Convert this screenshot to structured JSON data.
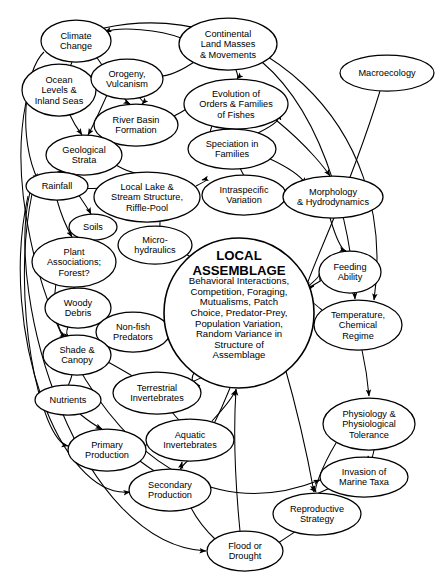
{
  "diagram": {
    "type": "concept-map",
    "background": "#ffffff",
    "line_color": "#000000",
    "width": 442,
    "height": 585,
    "central_node": {
      "id": "local-assemblage",
      "title_lines": [
        "LOCAL",
        "ASSEMBLAGE"
      ],
      "body_lines": [
        "Behavioral Interactions,",
        "Competition, Foraging,",
        "Mutualisms, Patch",
        "Choice, Predator-Prey,",
        "Population Variation,",
        "Random Variance in",
        "Structure of",
        "Assemblage"
      ],
      "cx": 239,
      "cy": 313,
      "rx": 75,
      "ry": 75
    },
    "nodes": [
      {
        "id": "climate-change",
        "lines": [
          "Climate",
          "Change"
        ],
        "cx": 76,
        "cy": 41,
        "rx": 35,
        "ry": 21
      },
      {
        "id": "continental-land-masses",
        "lines": [
          "Continental",
          "Land Masses",
          "& Movements"
        ],
        "cx": 228,
        "cy": 44,
        "rx": 49,
        "ry": 26
      },
      {
        "id": "macroecology",
        "lines": [
          "Macroecology"
        ],
        "cx": 387,
        "cy": 73,
        "rx": 47,
        "ry": 18
      },
      {
        "id": "ocean-levels",
        "lines": [
          "Ocean",
          "Levels &",
          "Inland Seas"
        ],
        "cx": 59,
        "cy": 90,
        "rx": 37,
        "ry": 26
      },
      {
        "id": "orogeny-vulcanism",
        "lines": [
          "Orogeny,",
          "Vulcanism"
        ],
        "cx": 127,
        "cy": 79,
        "rx": 36,
        "ry": 20
      },
      {
        "id": "evolution-orders",
        "lines": [
          "Evolution of",
          "Orders & Families",
          "of Fishes"
        ],
        "cx": 236,
        "cy": 104,
        "rx": 52,
        "ry": 25
      },
      {
        "id": "river-basin-formation",
        "lines": [
          "River Basin",
          "Formation"
        ],
        "cx": 136,
        "cy": 125,
        "rx": 42,
        "ry": 21
      },
      {
        "id": "speciation-in-families",
        "lines": [
          "Speciation in",
          "Families"
        ],
        "cx": 232,
        "cy": 149,
        "rx": 44,
        "ry": 20
      },
      {
        "id": "geological-strata",
        "lines": [
          "Geological",
          "Strata"
        ],
        "cx": 84,
        "cy": 155,
        "rx": 38,
        "ry": 20
      },
      {
        "id": "rainfall",
        "lines": [
          "Rainfall"
        ],
        "cx": 57,
        "cy": 186,
        "rx": 31,
        "ry": 14
      },
      {
        "id": "local-lake-stream",
        "lines": [
          "Local Lake &",
          "Stream Structure,",
          "Riffle-Pool"
        ],
        "cx": 147,
        "cy": 197,
        "rx": 53,
        "ry": 25
      },
      {
        "id": "intraspecific-variation",
        "lines": [
          "Intraspecific",
          "Variation"
        ],
        "cx": 244,
        "cy": 195,
        "rx": 42,
        "ry": 20
      },
      {
        "id": "morphology-hydrodynamics",
        "lines": [
          "Morphology",
          "& Hydrodynamics"
        ],
        "cx": 333,
        "cy": 197,
        "rx": 50,
        "ry": 21
      },
      {
        "id": "soils",
        "lines": [
          "Soils"
        ],
        "cx": 93,
        "cy": 227,
        "rx": 24,
        "ry": 13
      },
      {
        "id": "micro-hydraulics",
        "lines": [
          "Micro-",
          "hydraulics"
        ],
        "cx": 155,
        "cy": 245,
        "rx": 37,
        "ry": 19
      },
      {
        "id": "plant-associations",
        "lines": [
          "Plant",
          "Associations;",
          "Forest?"
        ],
        "cx": 74,
        "cy": 262,
        "rx": 42,
        "ry": 25
      },
      {
        "id": "feeding-ability",
        "lines": [
          "Feeding",
          "Ability"
        ],
        "cx": 350,
        "cy": 272,
        "rx": 31,
        "ry": 21
      },
      {
        "id": "woody-debris",
        "lines": [
          "Woody",
          "Debris"
        ],
        "cx": 78,
        "cy": 308,
        "rx": 33,
        "ry": 20
      },
      {
        "id": "non-fish-predators",
        "lines": [
          "Non-fish",
          "Predators"
        ],
        "cx": 133,
        "cy": 332,
        "rx": 37,
        "ry": 20
      },
      {
        "id": "temperature-chemical",
        "lines": [
          "Temperature,",
          "Chemical",
          "Regime"
        ],
        "cx": 358,
        "cy": 325,
        "rx": 44,
        "ry": 25
      },
      {
        "id": "shade-canopy",
        "lines": [
          "Shade &",
          "Canopy"
        ],
        "cx": 77,
        "cy": 355,
        "rx": 34,
        "ry": 20
      },
      {
        "id": "terrestrial-invertebrates",
        "lines": [
          "Terrestrial",
          "Invertebrates"
        ],
        "cx": 157,
        "cy": 393,
        "rx": 44,
        "ry": 21
      },
      {
        "id": "nutrients",
        "lines": [
          "Nutrients"
        ],
        "cx": 68,
        "cy": 400,
        "rx": 33,
        "ry": 15
      },
      {
        "id": "physiology-tolerance",
        "lines": [
          "Physiology &",
          "Physiological",
          "Tolerance"
        ],
        "cx": 369,
        "cy": 424,
        "rx": 46,
        "ry": 26
      },
      {
        "id": "aquatic-invertebrates",
        "lines": [
          "Aquatic",
          "Invertebrates"
        ],
        "cx": 190,
        "cy": 440,
        "rx": 44,
        "ry": 21
      },
      {
        "id": "primary-production",
        "lines": [
          "Primary",
          "Production"
        ],
        "cx": 107,
        "cy": 450,
        "rx": 39,
        "ry": 21
      },
      {
        "id": "invasion-marine-taxa",
        "lines": [
          "Invasion of",
          "Marine Taxa"
        ],
        "cx": 364,
        "cy": 477,
        "rx": 44,
        "ry": 20
      },
      {
        "id": "secondary-production",
        "lines": [
          "Secondary",
          "Production"
        ],
        "cx": 170,
        "cy": 490,
        "rx": 41,
        "ry": 21
      },
      {
        "id": "reproductive-strategy",
        "lines": [
          "Reproductive",
          "Strategy"
        ],
        "cx": 317,
        "cy": 514,
        "rx": 44,
        "ry": 21
      },
      {
        "id": "flood-or-drought",
        "lines": [
          "Flood or",
          "Drought"
        ],
        "cx": 245,
        "cy": 551,
        "rx": 38,
        "ry": 20
      }
    ],
    "edges": [
      {
        "from": "continental-land-masses",
        "to": "climate-change",
        "d": "M 181,38 C 160,30 120,26 105,32",
        "arrow": true
      },
      {
        "from": "continental-land-masses",
        "to": "orogeny-vulcanism",
        "d": "M 197,60 C 180,72 165,78 153,76",
        "arrow": true
      },
      {
        "from": "continental-land-masses",
        "to": "evolution-orders",
        "d": "M 236,70 C 238,75 238,78 237,79",
        "arrow": true
      },
      {
        "from": "climate-change",
        "to": "ocean-levels",
        "d": "M 72,62 C 70,68 68,70 66,64",
        "arrow": true
      },
      {
        "from": "climate-change",
        "to": "river-basin-formation",
        "d": "M 95,55 C 112,78 122,100 130,104",
        "arrow": true
      },
      {
        "from": "climate-change",
        "to": "rainfall",
        "d": "M 44,52 C 24,70 18,140 38,180",
        "arrow": true
      },
      {
        "from": "orogeny-vulcanism",
        "to": "river-basin-formation",
        "d": "M 140,98 C 146,106 146,100 142,104",
        "arrow": true
      },
      {
        "from": "orogeny-vulcanism",
        "to": "geological-strata",
        "d": "M 107,95 C 98,115 92,128 88,135",
        "arrow": true
      },
      {
        "from": "ocean-levels",
        "to": "geological-strata",
        "d": "M 70,115 C 76,128 80,132 82,135",
        "arrow": true
      },
      {
        "from": "river-basin-formation",
        "to": "geological-strata",
        "d": "M 110,137 C 100,143 96,146 94,148",
        "arrow": true
      },
      {
        "from": "river-basin-formation",
        "to": "evolution-orders",
        "d": "M 172,117 C 186,110 190,107 184,108",
        "arrow": true
      },
      {
        "from": "evolution-orders",
        "to": "speciation-in-families",
        "d": "M 212,126 C 208,136 210,140 214,137",
        "arrow": true
      },
      {
        "from": "speciation-in-families",
        "to": "intraspecific-variation",
        "d": "M 240,168 C 243,174 244,176 244,175",
        "arrow": true
      },
      {
        "from": "speciation-in-families",
        "to": "morphology-hydrodynamics",
        "d": "M 268,158 C 290,168 302,178 306,184",
        "arrow": true
      },
      {
        "from": "geological-strata",
        "to": "local-lake-stream",
        "d": "M 114,164 C 128,172 136,174 140,173",
        "arrow": true
      },
      {
        "from": "geological-strata",
        "to": "rainfall",
        "d": "M 66,170 C 60,174 58,172 57,172",
        "arrow": true
      },
      {
        "from": "rainfall",
        "to": "soils",
        "d": "M 78,194 C 86,206 90,212 91,214",
        "arrow": true
      },
      {
        "from": "rainfall",
        "to": "local-lake-stream",
        "d": "M 84,188 C 102,190 110,186 106,182",
        "arrow": true
      },
      {
        "from": "rainfall",
        "to": "plant-associations",
        "d": "M 57,200 C 62,218 68,230 72,237",
        "arrow": true
      },
      {
        "from": "local-lake-stream",
        "to": "micro-hydraulics",
        "d": "M 160,222 C 160,230 158,234 157,226",
        "arrow": true
      },
      {
        "from": "local-lake-stream",
        "to": "intraspecific-variation",
        "d": "M 196,186 C 208,180 210,178 202,180",
        "arrow": true
      },
      {
        "from": "intraspecific-variation",
        "to": "morphology-hydrodynamics",
        "d": "M 286,197 C 294,198 292,198 283,197",
        "arrow": true
      },
      {
        "from": "morphology-hydrodynamics",
        "to": "feeding-ability",
        "d": "M 330,218 C 336,238 342,250 346,251",
        "arrow": true
      },
      {
        "from": "soils",
        "to": "plant-associations",
        "d": "M 88,240 C 86,244 84,244 82,238",
        "arrow": true
      },
      {
        "from": "micro-hydraulics",
        "to": "local-assemblage",
        "d": "M 182,252 C 200,262 210,268 212,270",
        "arrow": true
      },
      {
        "from": "plant-associations",
        "to": "woody-debris",
        "d": "M 74,287 C 76,294 78,296 78,288",
        "arrow": true
      },
      {
        "from": "plant-associations",
        "to": "shade-canopy",
        "d": "M 56,283 C 52,310 58,332 66,338",
        "arrow": true
      },
      {
        "from": "woody-debris",
        "to": "non-fish-predators",
        "d": "M 108,318 C 120,324 126,326 128,322",
        "arrow": true
      },
      {
        "from": "woody-debris",
        "to": "shade-canopy",
        "d": "M 68,327 C 66,332 66,336 70,336",
        "arrow": true
      },
      {
        "from": "non-fish-predators",
        "to": "local-assemblage",
        "d": "M 170,330 C 184,326 190,322 186,324",
        "arrow": true
      },
      {
        "from": "local-assemblage",
        "to": "non-fish-predators",
        "d": "M 178,300 C 190,304 186,310 172,318",
        "arrow": true
      },
      {
        "from": "shade-canopy",
        "to": "nutrients",
        "d": "M 72,375 C 70,382 68,386 68,385",
        "arrow": true
      },
      {
        "from": "shade-canopy",
        "to": "terrestrial-invertebrates",
        "d": "M 108,362 C 126,372 136,378 140,381",
        "arrow": true
      },
      {
        "from": "nutrients",
        "to": "primary-production",
        "d": "M 80,414 C 92,424 100,428 102,429",
        "arrow": true
      },
      {
        "from": "terrestrial-invertebrates",
        "to": "aquatic-invertebrates",
        "d": "M 172,412 C 180,422 184,426 186,419",
        "arrow": true
      },
      {
        "from": "terrestrial-invertebrates",
        "to": "local-assemblage",
        "d": "M 192,382 C 214,372 222,368 224,366",
        "arrow": true
      },
      {
        "from": "primary-production",
        "to": "secondary-production",
        "d": "M 140,461 C 152,470 158,474 160,471",
        "arrow": true
      },
      {
        "from": "primary-production",
        "to": "aquatic-invertebrates",
        "d": "M 144,446 C 154,442 156,440 146,440",
        "arrow": true
      },
      {
        "from": "secondary-production",
        "to": "aquatic-invertebrates",
        "d": "M 180,469 C 186,462 188,460 189,461",
        "arrow": true
      },
      {
        "from": "aquatic-invertebrates",
        "to": "local-assemblage",
        "d": "M 212,421 C 226,406 234,394 236,390",
        "arrow": true
      },
      {
        "from": "feeding-ability",
        "to": "local-assemblage",
        "d": "M 322,280 C 312,286 308,288 314,286",
        "arrow": true
      },
      {
        "from": "local-assemblage",
        "to": "feeding-ability",
        "d": "M 306,288 C 316,280 320,276 319,274",
        "arrow": true
      },
      {
        "from": "temperature-chemical",
        "to": "local-assemblage",
        "d": "M 322,310 C 312,302 310,300 314,302",
        "arrow": true
      },
      {
        "from": "temperature-chemical",
        "to": "physiology-tolerance",
        "d": "M 362,350 C 366,368 368,384 369,396",
        "arrow": true
      },
      {
        "from": "physiology-tolerance",
        "to": "invasion-marine-taxa",
        "d": "M 374,450 C 372,460 370,464 368,456",
        "arrow": true
      },
      {
        "from": "physiology-tolerance",
        "to": "reproductive-strategy",
        "d": "M 336,443 C 320,470 314,490 316,492",
        "arrow": true
      },
      {
        "from": "invasion-marine-taxa",
        "to": "reproductive-strategy",
        "d": "M 330,488 C 312,496 300,502 298,504",
        "arrow": true
      },
      {
        "from": "flood-or-drought",
        "to": "reproductive-strategy",
        "d": "M 278,543 C 292,534 298,530 296,530",
        "arrow": true
      },
      {
        "from": "flood-or-drought",
        "to": "aquatic-invertebrates",
        "d": "M 216,540 C 186,512 178,480 182,462",
        "arrow": true
      },
      {
        "from": "flood-or-drought",
        "to": "local-assemblage",
        "d": "M 240,531 C 234,470 234,420 236,389",
        "arrow": true
      },
      {
        "from": "local-assemblage",
        "to": "reproductive-strategy",
        "d": "M 284,364 C 300,420 310,470 314,492",
        "arrow": true
      },
      {
        "from": "macroecology",
        "to": "local-assemblage",
        "d": "M 380,91 C 350,190 310,270 306,288",
        "arrow": true
      },
      {
        "from": "continental-land-masses",
        "to": "temperature-chemical",
        "d": "M 262,62 C 330,120 352,240 355,299",
        "arrow": true
      },
      {
        "from": "climate-change",
        "to": "temperature-chemical",
        "d": "M 104,28 C 250,-4 400,120 374,300",
        "arrow": true
      },
      {
        "from": "rainfall",
        "to": "flood-or-drought",
        "d": "M 30,192 C 4,300 80,545 206,551",
        "arrow": true
      },
      {
        "from": "rainfall",
        "to": "primary-production",
        "d": "M 32,194 C 10,300 40,440 68,446",
        "arrow": true
      },
      {
        "from": "rainfall",
        "to": "secondary-production",
        "d": "M 28,196 C -2,330 60,500 130,492",
        "arrow": true
      },
      {
        "from": "ocean-levels",
        "to": "invasion-marine-taxa",
        "d": "M 26,102 C -6,260 120,560 320,480",
        "arrow": true
      },
      {
        "from": "local-assemblage",
        "to": "terrestrial-invertebrates",
        "d": "M 208,356 C 192,372 186,382 200,386",
        "arrow": true
      },
      {
        "from": "local-assemblage",
        "to": "aquatic-invertebrates",
        "d": "M 230,388 C 222,408 214,424 212,428",
        "arrow": true
      },
      {
        "from": "evolution-orders",
        "to": "morphology-hydrodynamics",
        "d": "M 276,120 C 310,148 326,170 330,176",
        "arrow": true
      },
      {
        "from": "speciation-in-families",
        "to": "evolution-orders",
        "d": "M 258,133 C 276,124 282,118 276,116",
        "arrow": true
      }
    ]
  }
}
